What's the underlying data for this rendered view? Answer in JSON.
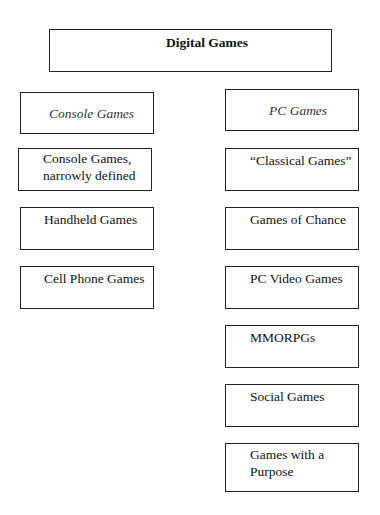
{
  "diagram": {
    "root": {
      "label": "Digital Games"
    },
    "columns": [
      {
        "header": "Console Games",
        "items": [
          "Console Games, narrowly defined",
          "Handheld Games",
          "Cell Phone Games"
        ]
      },
      {
        "header": "PC Games",
        "items": [
          "“Classical Games”",
          "Games of Chance",
          "PC Video Games",
          "MMORPGs",
          "Social Games",
          "Games with a Purpose"
        ]
      }
    ]
  },
  "labels": {
    "console_1a": "Console Games,",
    "console_1b": "narrowly defined",
    "purpose_a": "Games with a",
    "purpose_b": "Purpose"
  }
}
